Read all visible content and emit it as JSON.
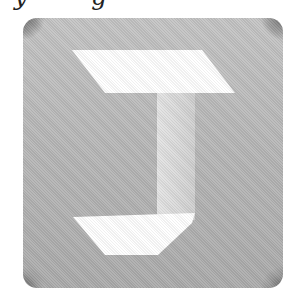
{
  "caption": {
    "text_fragment": "y g"
  },
  "icon": {
    "name": "letter-j-app-icon",
    "tile_color": "#b6b6b6",
    "corner_shade_color": "#6a6a6a",
    "top_bar_color": "#ffffff",
    "stem_color": "#dcdcdc",
    "bottom_bar_color": "#ffffff"
  }
}
